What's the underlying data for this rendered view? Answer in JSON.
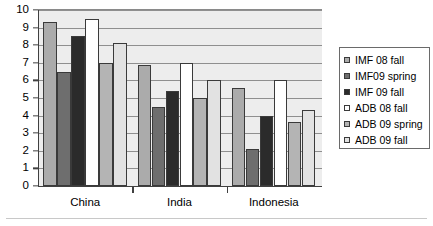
{
  "chart_data": {
    "type": "bar",
    "title": "",
    "subtitle": "",
    "xlabel": "",
    "ylabel": "",
    "categories": [
      "China",
      "India",
      "Indonesia"
    ],
    "ylim": [
      0,
      10
    ],
    "yticks": [
      0,
      1,
      2,
      3,
      4,
      5,
      6,
      7,
      8,
      9,
      10
    ],
    "ytick_labels": [
      "0",
      "1",
      "2",
      "3",
      "4",
      "5",
      "6",
      "7",
      "8",
      "9",
      "10"
    ],
    "grid": true,
    "grid_axis": "y",
    "legend_position": "right",
    "plot_background": "#ededed",
    "series": [
      {
        "name": "IMF 08 fall",
        "color": "#ababab",
        "values": [
          9.3,
          6.85,
          5.55
        ]
      },
      {
        "name": "IMF09 spring",
        "color": "#6e6e6e",
        "values": [
          6.5,
          4.5,
          2.1
        ]
      },
      {
        "name": "IMF 09 fall",
        "color": "#2b2b2b",
        "values": [
          8.5,
          5.4,
          4.0
        ]
      },
      {
        "name": "ADB 08 fall",
        "color": "#ffffff",
        "values": [
          9.5,
          7.0,
          6.0
        ]
      },
      {
        "name": "ADB 09 spring",
        "color": "#b4b4b4",
        "values": [
          7.0,
          5.0,
          3.65
        ]
      },
      {
        "name": "ADB 09 fall",
        "color": "#e2e2e2",
        "values": [
          8.15,
          6.0,
          4.3
        ]
      }
    ]
  },
  "legend": {
    "items": [
      {
        "label": "IMF 08 fall"
      },
      {
        "label": "IMF09 spring"
      },
      {
        "label": "IMF 09 fall"
      },
      {
        "label": "ADB 08 fall"
      },
      {
        "label": "ADB 09 spring"
      },
      {
        "label": "ADB 09 fall"
      }
    ]
  }
}
